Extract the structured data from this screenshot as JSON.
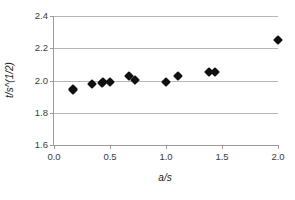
{
  "chart_data": {
    "type": "scatter",
    "title": "",
    "xlabel": "a/s",
    "ylabel": "t/s^(1/2)",
    "xlim": [
      0.0,
      2.0
    ],
    "ylim": [
      1.6,
      2.4
    ],
    "xticks": [
      "0.0",
      "0.5",
      "1.0",
      "1.5",
      "2.0"
    ],
    "xtick_values": [
      0.0,
      0.5,
      1.0,
      1.5,
      2.0
    ],
    "yticks": [
      "1.6",
      "1.8",
      "2.0",
      "2.2",
      "2.4"
    ],
    "ytick_values": [
      1.6,
      1.8,
      2.0,
      2.2,
      2.4
    ],
    "grid": "horizontal",
    "legend": "none",
    "marker": "diamond",
    "marker_color": "#111111",
    "gridline_color": "#b6b6b6",
    "axis_color": "#9a9a9a",
    "background": "#ffffff",
    "series": [
      {
        "name": "t/s^(1/2) vs a/s",
        "points": [
          {
            "x": 0.17,
            "y": 1.95
          },
          {
            "x": 0.17,
            "y": 1.94
          },
          {
            "x": 0.34,
            "y": 1.98
          },
          {
            "x": 0.43,
            "y": 1.985
          },
          {
            "x": 0.44,
            "y": 1.99
          },
          {
            "x": 0.5,
            "y": 1.99
          },
          {
            "x": 0.67,
            "y": 2.025
          },
          {
            "x": 0.72,
            "y": 2.005
          },
          {
            "x": 1.0,
            "y": 1.99
          },
          {
            "x": 1.11,
            "y": 2.03
          },
          {
            "x": 1.38,
            "y": 2.05
          },
          {
            "x": 1.44,
            "y": 2.05
          },
          {
            "x": 2.0,
            "y": 2.25
          }
        ]
      }
    ]
  }
}
